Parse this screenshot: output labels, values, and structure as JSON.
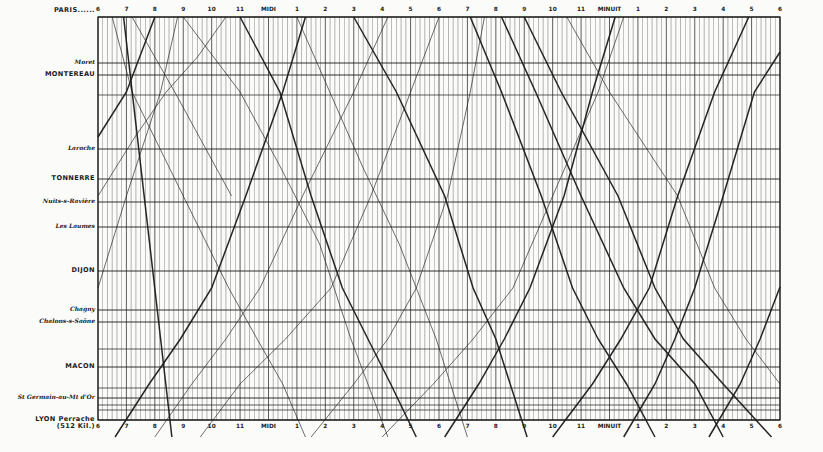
{
  "chart_data": {
    "type": "line",
    "xlabel": "",
    "ylabel": "",
    "x_ticks_top": [
      "6",
      "7",
      "8",
      "9",
      "10",
      "11",
      "MIDI",
      "1",
      "2",
      "3",
      "4",
      "5",
      "6",
      "7",
      "8",
      "9",
      "10",
      "11",
      "MINUIT",
      "1",
      "2",
      "3",
      "4",
      "5",
      "6"
    ],
    "x_ticks_bottom": [
      "6",
      "7",
      "8",
      "9",
      "10",
      "11",
      "MIDI",
      "1",
      "2",
      "3",
      "4",
      "5",
      "6",
      "7",
      "8",
      "9",
      "10",
      "11",
      "MINUIT",
      "1",
      "2",
      "3",
      "4",
      "5",
      "6"
    ],
    "x_range_hours": [
      6,
      30
    ],
    "grid": true,
    "stations": [
      {
        "name": "PARIS......",
        "style": "major",
        "y": 17
      },
      {
        "name": "Moret",
        "style": "minor",
        "y": 63
      },
      {
        "name": "MONTEREAU",
        "style": "major",
        "y": 75
      },
      {
        "name": "Laroche",
        "style": "minor",
        "y": 149
      },
      {
        "name": "TONNERRE",
        "style": "major",
        "y": 179
      },
      {
        "name": "Nuits-s-Ravière",
        "style": "minor",
        "y": 202
      },
      {
        "name": "Les Laumes",
        "style": "minor",
        "y": 227
      },
      {
        "name": "DIJON",
        "style": "major",
        "y": 271
      },
      {
        "name": "Chagny",
        "style": "minor",
        "y": 310
      },
      {
        "name": "Chalons-s-Saône",
        "style": "minor",
        "y": 322
      },
      {
        "name": "MACON",
        "style": "major",
        "y": 367
      },
      {
        "name": "St Germain-au-Mt d'Or",
        "style": "minor",
        "y": 398
      },
      {
        "name": "LYON Perrache",
        "style": "major",
        "y": 420
      },
      {
        "name": "(512 Kil.)",
        "style": "major",
        "y": 427
      }
    ],
    "series": [
      {
        "name": "down-1",
        "dir": "down",
        "weight": "heavy",
        "points": [
          [
            6.9,
            0
          ],
          [
            8.6,
            420
          ]
        ]
      },
      {
        "name": "down-2",
        "dir": "down",
        "weight": "light",
        "points": [
          [
            6.5,
            0
          ],
          [
            7.2,
            75
          ],
          [
            9.0,
            179
          ],
          [
            10.6,
            271
          ],
          [
            11.6,
            322
          ],
          [
            12.5,
            367
          ],
          [
            13.3,
            420
          ]
        ]
      },
      {
        "name": "down-3",
        "dir": "down",
        "weight": "light",
        "points": [
          [
            7.2,
            0
          ],
          [
            8.7,
            75
          ],
          [
            10.7,
            179
          ]
        ]
      },
      {
        "name": "down-4",
        "dir": "down",
        "weight": "light",
        "points": [
          [
            9.0,
            0
          ],
          [
            11.0,
            75
          ],
          [
            12.4,
            149
          ],
          [
            13.8,
            227
          ],
          [
            14.9,
            322
          ],
          [
            16.2,
            420
          ]
        ]
      },
      {
        "name": "down-5",
        "dir": "down",
        "weight": "heavy",
        "points": [
          [
            11.0,
            0
          ],
          [
            12.4,
            75
          ],
          [
            13.5,
            179
          ],
          [
            14.6,
            271
          ],
          [
            15.5,
            322
          ],
          [
            16.3,
            367
          ],
          [
            17.2,
            420
          ]
        ]
      },
      {
        "name": "down-6",
        "dir": "down",
        "weight": "light",
        "points": [
          [
            13.0,
            0
          ],
          [
            15.3,
            149
          ],
          [
            16.6,
            227
          ],
          [
            17.9,
            322
          ],
          [
            19.0,
            420
          ]
        ]
      },
      {
        "name": "down-7",
        "dir": "down",
        "weight": "heavy",
        "points": [
          [
            15.0,
            0
          ],
          [
            16.5,
            75
          ],
          [
            18.2,
            179
          ],
          [
            19.2,
            271
          ],
          [
            20.0,
            322
          ],
          [
            21.1,
            420
          ]
        ]
      },
      {
        "name": "down-8",
        "dir": "down",
        "weight": "heavy",
        "points": [
          [
            19.1,
            0
          ],
          [
            20.2,
            75
          ],
          [
            21.6,
            179
          ],
          [
            22.7,
            271
          ],
          [
            23.6,
            322
          ],
          [
            24.6,
            367
          ],
          [
            25.6,
            420
          ]
        ]
      },
      {
        "name": "down-9",
        "dir": "down",
        "weight": "heavy",
        "points": [
          [
            20.2,
            0
          ],
          [
            21.4,
            75
          ],
          [
            23.0,
            179
          ],
          [
            24.5,
            271
          ],
          [
            25.6,
            322
          ],
          [
            27.0,
            367
          ],
          [
            28.0,
            420
          ]
        ]
      },
      {
        "name": "down-10",
        "dir": "down",
        "weight": "heavy",
        "points": [
          [
            21.0,
            0
          ],
          [
            22.3,
            75
          ],
          [
            24.3,
            179
          ],
          [
            25.6,
            271
          ],
          [
            26.6,
            322
          ],
          [
            28.0,
            367
          ],
          [
            29.7,
            420
          ]
        ]
      },
      {
        "name": "down-11",
        "dir": "down",
        "weight": "light",
        "points": [
          [
            22.5,
            0
          ],
          [
            24.0,
            75
          ],
          [
            26.4,
            179
          ],
          [
            27.7,
            271
          ],
          [
            28.8,
            322
          ],
          [
            30.0,
            367
          ]
        ]
      },
      {
        "name": "up-1",
        "dir": "up",
        "weight": "heavy",
        "points": [
          [
            6.6,
            420
          ],
          [
            7.8,
            367
          ],
          [
            8.9,
            322
          ],
          [
            10.0,
            271
          ],
          [
            11.2,
            179
          ],
          [
            12.5,
            75
          ],
          [
            13.3,
            0
          ]
        ]
      },
      {
        "name": "up-2",
        "dir": "up",
        "weight": "light",
        "points": [
          [
            8.0,
            420
          ],
          [
            9.3,
            367
          ],
          [
            10.5,
            322
          ],
          [
            11.7,
            271
          ],
          [
            13.2,
            179
          ],
          [
            15.0,
            75
          ],
          [
            16.2,
            0
          ]
        ]
      },
      {
        "name": "up-3",
        "dir": "up",
        "weight": "light",
        "points": [
          [
            9.6,
            420
          ],
          [
            11.0,
            367
          ],
          [
            12.6,
            322
          ],
          [
            14.2,
            271
          ],
          [
            15.6,
            179
          ],
          [
            17.0,
            75
          ],
          [
            18.0,
            0
          ]
        ]
      },
      {
        "name": "up-4",
        "dir": "up",
        "weight": "light",
        "points": [
          [
            6.0,
            271
          ],
          [
            7.0,
            179
          ],
          [
            8.2,
            75
          ],
          [
            8.8,
            0
          ]
        ]
      },
      {
        "name": "up-5",
        "dir": "up",
        "weight": "heavy",
        "points": [
          [
            6.0,
            120
          ],
          [
            7.0,
            75
          ],
          [
            8.0,
            0
          ]
        ]
      },
      {
        "name": "up-6",
        "dir": "up",
        "weight": "light",
        "points": [
          [
            6.0,
            179
          ],
          [
            7.3,
            120
          ],
          [
            8.4,
            75
          ],
          [
            9.5,
            40
          ],
          [
            10.5,
            0
          ]
        ]
      },
      {
        "name": "up-7",
        "dir": "up",
        "weight": "light",
        "points": [
          [
            13.5,
            420
          ],
          [
            15.0,
            367
          ],
          [
            16.2,
            322
          ],
          [
            17.2,
            271
          ],
          [
            18.3,
            179
          ],
          [
            19.1,
            75
          ],
          [
            19.6,
            0
          ]
        ]
      },
      {
        "name": "up-8",
        "dir": "up",
        "weight": "heavy",
        "points": [
          [
            18.2,
            420
          ],
          [
            19.4,
            367
          ],
          [
            20.3,
            322
          ],
          [
            21.2,
            271
          ],
          [
            22.4,
            179
          ],
          [
            23.4,
            75
          ],
          [
            24.2,
            0
          ]
        ]
      },
      {
        "name": "up-9",
        "dir": "up",
        "weight": "heavy",
        "points": [
          [
            22.0,
            420
          ],
          [
            23.4,
            367
          ],
          [
            24.4,
            322
          ],
          [
            25.4,
            271
          ],
          [
            26.4,
            179
          ],
          [
            27.7,
            75
          ],
          [
            28.9,
            0
          ]
        ]
      },
      {
        "name": "up-10",
        "dir": "up",
        "weight": "heavy",
        "points": [
          [
            24.5,
            420
          ],
          [
            25.6,
            367
          ],
          [
            26.3,
            322
          ],
          [
            27.0,
            271
          ],
          [
            28.0,
            179
          ],
          [
            29.1,
            75
          ],
          [
            30.0,
            35
          ]
        ]
      },
      {
        "name": "up-11",
        "dir": "up",
        "weight": "heavy",
        "points": [
          [
            27.5,
            420
          ],
          [
            28.6,
            367
          ],
          [
            29.3,
            322
          ],
          [
            30.0,
            270
          ]
        ]
      },
      {
        "name": "up-12",
        "dir": "up",
        "weight": "light",
        "points": [
          [
            16.0,
            420
          ],
          [
            17.8,
            367
          ],
          [
            19.2,
            322
          ],
          [
            20.6,
            271
          ],
          [
            22.0,
            179
          ],
          [
            23.6,
            75
          ],
          [
            24.5,
            0
          ]
        ]
      }
    ],
    "legend": null
  },
  "layout": {
    "chart_left": 98,
    "chart_right": 780,
    "chart_top": 17,
    "chart_bottom": 420,
    "minor_vlines_per_hour": 6
  },
  "colors": {
    "background": "#fbfbfa",
    "ink": "#1a1a1a",
    "grid": "#3a3a3a"
  }
}
